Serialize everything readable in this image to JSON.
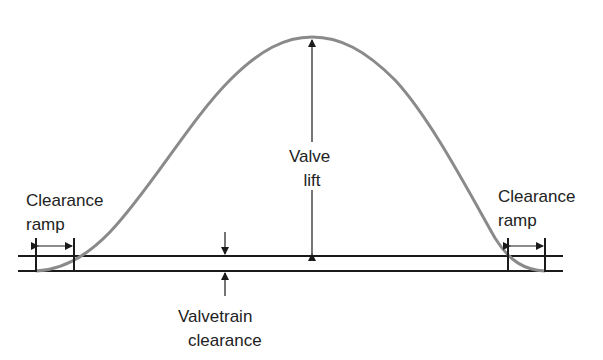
{
  "diagram": {
    "labels": {
      "valve_lift": [
        "Valve",
        "lift"
      ],
      "clearance_ramp_left": [
        "Clearance",
        "ramp"
      ],
      "clearance_ramp_right": [
        "Clearance",
        "ramp"
      ],
      "valvetrain_clearance": [
        "Valvetrain",
        "clearance"
      ]
    },
    "colors": {
      "curve": "#8a8a8a",
      "lines": "#1a1a1a",
      "text": "#222222",
      "background": "#ffffff"
    }
  }
}
